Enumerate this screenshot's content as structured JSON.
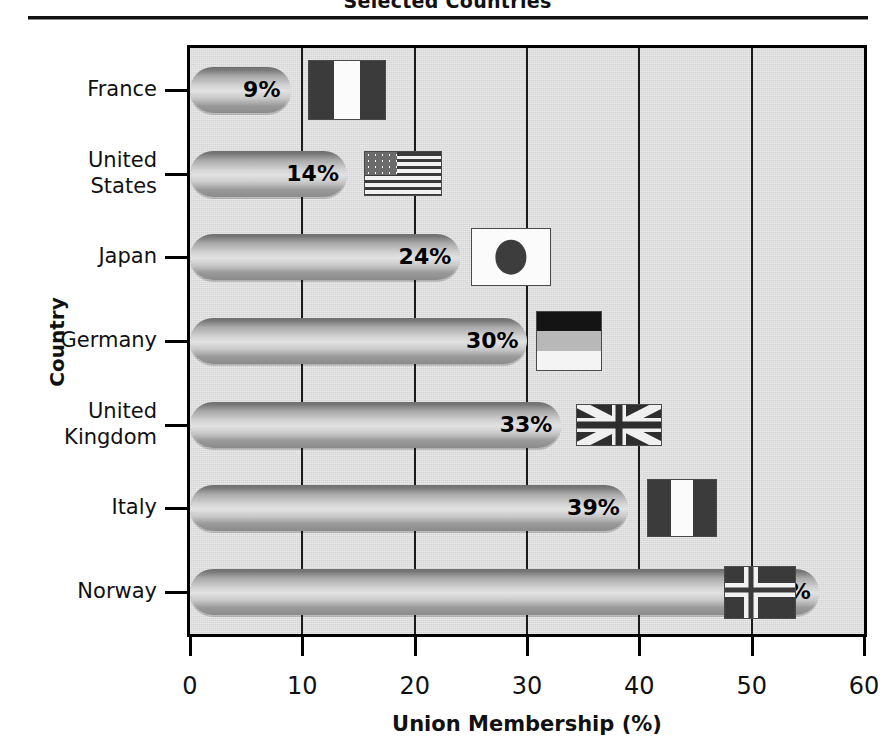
{
  "header": {
    "title": "Selected Countries",
    "divider": "horizontal-rule"
  },
  "chart_data": {
    "type": "bar",
    "orientation": "horizontal",
    "title": "Selected Countries",
    "xlabel": "Union Membership (%)",
    "ylabel": "Country",
    "categories": [
      "France",
      "United States",
      "Japan",
      "Germany",
      "United Kingdom",
      "Italy",
      "Norway"
    ],
    "values": [
      9,
      14,
      24,
      30,
      33,
      39,
      56
    ],
    "value_labels": [
      "9%",
      "14%",
      "24%",
      "30%",
      "33%",
      "39%",
      "56%"
    ],
    "xlim": [
      0,
      60
    ],
    "xticks": [
      0,
      10,
      20,
      30,
      40,
      50,
      60
    ],
    "xtick_labels": [
      "0",
      "10",
      "20",
      "30",
      "40",
      "50",
      "60"
    ],
    "grid": "vertical",
    "legend": "none",
    "annotations": [
      {
        "category": "France",
        "icon": "flag-france"
      },
      {
        "category": "United States",
        "icon": "flag-united-states"
      },
      {
        "category": "Japan",
        "icon": "flag-japan"
      },
      {
        "category": "Germany",
        "icon": "flag-germany"
      },
      {
        "category": "United Kingdom",
        "icon": "flag-united-kingdom"
      },
      {
        "category": "Italy",
        "icon": "flag-italy"
      },
      {
        "category": "Norway",
        "icon": "flag-norway"
      }
    ],
    "colors": {
      "plot_background": "#dcdcdc",
      "bar_fill": "#c9c9c9",
      "axis": "#000000",
      "grid": "#1b1b1b",
      "text": "#111111"
    }
  },
  "axis": {
    "y_labels": [
      {
        "line1": "France",
        "line2": ""
      },
      {
        "line1": "United",
        "line2": "States"
      },
      {
        "line1": "Japan",
        "line2": ""
      },
      {
        "line1": "Germany",
        "line2": ""
      },
      {
        "line1": "United",
        "line2": "Kingdom"
      },
      {
        "line1": "Italy",
        "line2": ""
      },
      {
        "line1": "Norway",
        "line2": ""
      }
    ],
    "x_tick_labels": [
      "0",
      "10",
      "20",
      "30",
      "40",
      "50",
      "60"
    ],
    "x_title": "Union Membership (%)",
    "y_title": "Country"
  }
}
